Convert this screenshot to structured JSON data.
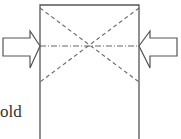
{
  "diagram": {
    "label": "old",
    "colors": {
      "stroke": "#555555",
      "dash": "#666666"
    }
  }
}
